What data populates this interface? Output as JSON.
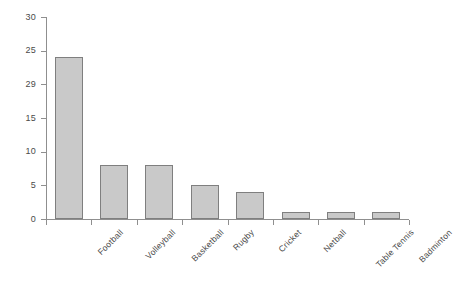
{
  "chart_data": {
    "type": "bar",
    "title": "",
    "subtitle": "",
    "xlabel": "",
    "ylabel": "",
    "categories": [
      "Football",
      "Volleyball",
      "Basketball",
      "Rugby",
      "Cricket",
      "Netball",
      "Table Tennis",
      "Badminton"
    ],
    "values": [
      24,
      8,
      8,
      5,
      4,
      1,
      1,
      1
    ],
    "ylim": [
      0,
      30
    ],
    "ytick_values": [
      0,
      5,
      10,
      15,
      20,
      25,
      30
    ],
    "ytick_labels": [
      "0",
      "5",
      "10",
      "15",
      "29",
      "25",
      "30"
    ],
    "grid": false,
    "legend": null,
    "bar_color": "#c9c9c9",
    "bar_border_color": "#7f7f7f",
    "axis_color": "#8f8f8f",
    "text_color": "#4a4a4a",
    "background": "#ffffff"
  }
}
